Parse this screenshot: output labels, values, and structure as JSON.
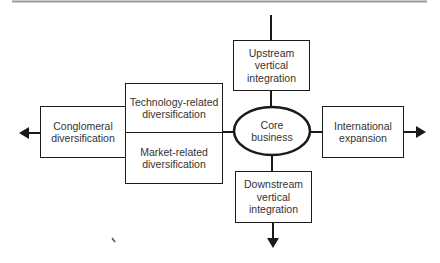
{
  "diagram": {
    "type": "growth-directions",
    "colors": {
      "stroke": "#1a1a1a",
      "text": "#333333",
      "header_rule": "#9a9a9a",
      "background": "#ffffff"
    },
    "nodes": {
      "core": {
        "lines": [
          "Core",
          "business"
        ]
      },
      "upstream": {
        "lines": [
          "Upstream",
          "vertical",
          "integration"
        ]
      },
      "downstream": {
        "lines": [
          "Downstream",
          "vertical",
          "integration"
        ]
      },
      "technology": {
        "lines": [
          "Technology-related",
          "diversification"
        ]
      },
      "market": {
        "lines": [
          "Market-related",
          "diversification"
        ]
      },
      "conglomeral": {
        "lines": [
          "Conglomeral",
          "diversification"
        ]
      },
      "international": {
        "lines": [
          "International",
          "expansion"
        ]
      }
    },
    "arrows": [
      {
        "from": "conglomeral",
        "direction": "left"
      },
      {
        "from": "international",
        "direction": "right"
      },
      {
        "from": "downstream",
        "direction": "down"
      }
    ]
  }
}
